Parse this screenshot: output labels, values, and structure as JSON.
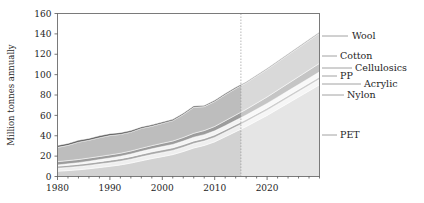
{
  "chart_data": {
    "type": "area",
    "title": "",
    "xlabel": "",
    "ylabel": "Million tonnes annually",
    "xlim": [
      1980,
      2030
    ],
    "ylim": [
      0,
      160
    ],
    "xticks": [
      1980,
      1990,
      2000,
      2010,
      2020
    ],
    "yticks": [
      0,
      20,
      40,
      60,
      80,
      100,
      120,
      140,
      160
    ],
    "grid": false,
    "legend_position": "right-outside-leader-lines",
    "stacked": true,
    "forecast_divider_year": 2015,
    "x": [
      1980,
      1982,
      1984,
      1986,
      1988,
      1990,
      1992,
      1994,
      1996,
      1998,
      2000,
      2002,
      2004,
      2006,
      2008,
      2010,
      2012,
      2014,
      2015,
      2016,
      2018,
      2020,
      2022,
      2024,
      2026,
      2028,
      2030
    ],
    "series": [
      {
        "name": "PET",
        "color": "#d2d2d2",
        "values": [
          5.2,
          5.8,
          6.6,
          7.6,
          8.8,
          10.0,
          11.4,
          13.2,
          15.4,
          17.6,
          19.5,
          21.5,
          24.5,
          28.0,
          30.5,
          34.0,
          39.0,
          44.0,
          46.5,
          49.0,
          54.5,
          60.0,
          66.0,
          72.0,
          78.0,
          84.0,
          90.0
        ]
      },
      {
        "name": "Nylon",
        "color": "#efefef",
        "values": [
          3.0,
          3.1,
          3.2,
          3.3,
          3.4,
          3.5,
          3.6,
          3.7,
          3.9,
          4.0,
          4.1,
          4.1,
          4.2,
          4.3,
          4.3,
          4.4,
          4.5,
          4.6,
          4.6,
          4.7,
          4.8,
          4.9,
          5.0,
          5.1,
          5.2,
          5.3,
          5.4
        ]
      },
      {
        "name": "Acrylic",
        "color": "#a9a9a9",
        "values": [
          2.0,
          2.1,
          2.2,
          2.3,
          2.4,
          2.5,
          2.5,
          2.6,
          2.6,
          2.6,
          2.6,
          2.6,
          2.6,
          2.6,
          2.5,
          2.5,
          2.4,
          2.4,
          2.4,
          2.4,
          2.4,
          2.4,
          2.4,
          2.4,
          2.4,
          2.4,
          2.4
        ]
      },
      {
        "name": "PP",
        "color": "#f4f4f4",
        "values": [
          1.2,
          1.4,
          1.6,
          1.8,
          2.0,
          2.2,
          2.4,
          2.6,
          2.8,
          3.0,
          3.2,
          3.3,
          3.5,
          3.7,
          3.8,
          3.9,
          4.0,
          4.1,
          4.2,
          4.2,
          4.3,
          4.4,
          4.5,
          4.6,
          4.7,
          4.8,
          4.9
        ]
      },
      {
        "name": "Cellulosics",
        "color": "#9c9c9c",
        "values": [
          3.2,
          3.2,
          3.1,
          3.1,
          3.0,
          3.0,
          2.9,
          2.9,
          3.0,
          3.1,
          3.2,
          3.3,
          3.5,
          3.8,
          4.0,
          4.3,
          4.8,
          5.2,
          5.4,
          5.6,
          6.0,
          6.4,
          6.8,
          7.2,
          7.6,
          8.0,
          8.4
        ]
      },
      {
        "name": "Cotton",
        "color": "#bdbdbd",
        "values": [
          14.0,
          15.0,
          17.0,
          17.5,
          18.5,
          19.0,
          18.5,
          18.5,
          19.5,
          19.0,
          19.5,
          20.0,
          22.5,
          25.5,
          23.5,
          24.5,
          25.5,
          26.0,
          26.0,
          26.0,
          26.5,
          27.0,
          27.5,
          28.0,
          28.5,
          29.0,
          29.5
        ]
      },
      {
        "name": "Wool",
        "color": "#5a5a5a",
        "values": [
          1.8,
          1.8,
          1.8,
          1.8,
          1.8,
          1.8,
          1.7,
          1.6,
          1.5,
          1.4,
          1.4,
          1.3,
          1.3,
          1.3,
          1.2,
          1.2,
          1.2,
          1.2,
          1.2,
          1.2,
          1.2,
          1.2,
          1.2,
          1.2,
          1.2,
          1.2,
          1.2
        ]
      }
    ],
    "legend_entries": [
      {
        "label": "Wool",
        "y": 36,
        "text_x": 352,
        "line_x1": 322,
        "line_x2": 348
      },
      {
        "label": "Cotton",
        "y": 56,
        "text_x": 340,
        "line_x1": 322,
        "line_x2": 337
      },
      {
        "label": "Cellulosics",
        "y": 68,
        "text_x": 355,
        "line_x1": 322,
        "line_x2": 352
      },
      {
        "label": "PP",
        "y": 76,
        "text_x": 340,
        "line_x1": 322,
        "line_x2": 337
      },
      {
        "label": "Acrylic",
        "y": 84,
        "text_x": 364,
        "line_x1": 322,
        "line_x2": 361
      },
      {
        "label": "Nylon",
        "y": 95,
        "text_x": 347,
        "line_x1": 322,
        "line_x2": 344
      },
      {
        "label": "PET",
        "y": 135,
        "text_x": 340,
        "line_x1": 322,
        "line_x2": 337
      }
    ]
  }
}
